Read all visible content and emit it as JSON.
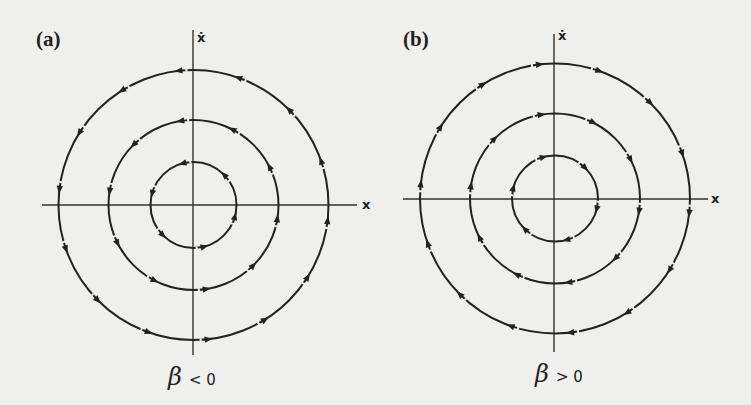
{
  "figure": {
    "panels": [
      {
        "id": "a",
        "label": "(a)",
        "x_axis_label": "x",
        "y_axis_label": "ẋ",
        "condition": {
          "symbol": "β",
          "relation": "< 0"
        },
        "flow_direction": "counterclockwise",
        "orbits": 3,
        "arrows_per_orbit": [
          6,
          10,
          14
        ]
      },
      {
        "id": "b",
        "label": "(b)",
        "x_axis_label": "x",
        "y_axis_label": "ẋ",
        "condition": {
          "symbol": "β",
          "relation": "> 0"
        },
        "flow_direction": "clockwise",
        "orbits": 3,
        "arrows_per_orbit": [
          6,
          10,
          14
        ]
      }
    ],
    "colors": {
      "ink": "#222222",
      "background": "#efefed"
    }
  }
}
